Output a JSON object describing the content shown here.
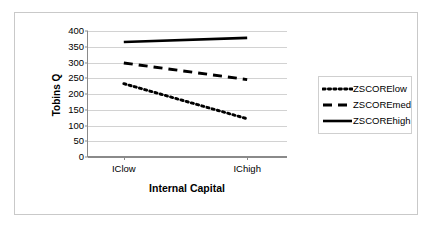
{
  "chart_data": {
    "type": "line",
    "title": "",
    "xlabel": "Internal Capital",
    "ylabel": "Tobins Q",
    "categories": [
      "IClow",
      "IChigh"
    ],
    "ylim": [
      0,
      400
    ],
    "yticks": [
      400,
      350,
      300,
      250,
      200,
      150,
      100,
      50,
      0
    ],
    "grid": true,
    "legend_position": "right",
    "series": [
      {
        "name": "ZSCORElow",
        "values": [
          232,
          120
        ],
        "style": "dotted",
        "color": "#000000"
      },
      {
        "name": "ZSCOREmed",
        "values": [
          298,
          245
        ],
        "style": "dashed",
        "color": "#000000"
      },
      {
        "name": "ZSCOREhigh",
        "values": [
          365,
          378
        ],
        "style": "solid",
        "color": "#000000"
      }
    ]
  },
  "legend": {
    "items": [
      {
        "label": "ZSCORElow"
      },
      {
        "label": "ZSCOREmed"
      },
      {
        "label": "ZSCOREhigh"
      }
    ]
  }
}
